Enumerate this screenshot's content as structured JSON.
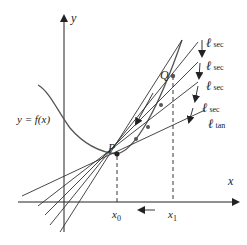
{
  "diagram": {
    "axes": {
      "x_label": "x",
      "y_label": "y"
    },
    "curve_label": "y = f(x)",
    "points": {
      "P": "P",
      "Q": "Q"
    },
    "ticks": {
      "x0": "x",
      "x0_sub": "0",
      "x1": "x",
      "x1_sub": "1"
    },
    "lines": [
      {
        "name": "ell",
        "sub": "sec"
      },
      {
        "name": "ell",
        "sub": "sec"
      },
      {
        "name": "ell",
        "sub": "sec"
      },
      {
        "name": "ell",
        "sub": "sec"
      },
      {
        "name": "ell",
        "sub": "tan"
      }
    ],
    "line_glyph": "ℓ",
    "colors": {
      "ink": "#222222",
      "curve": "#555555"
    }
  }
}
